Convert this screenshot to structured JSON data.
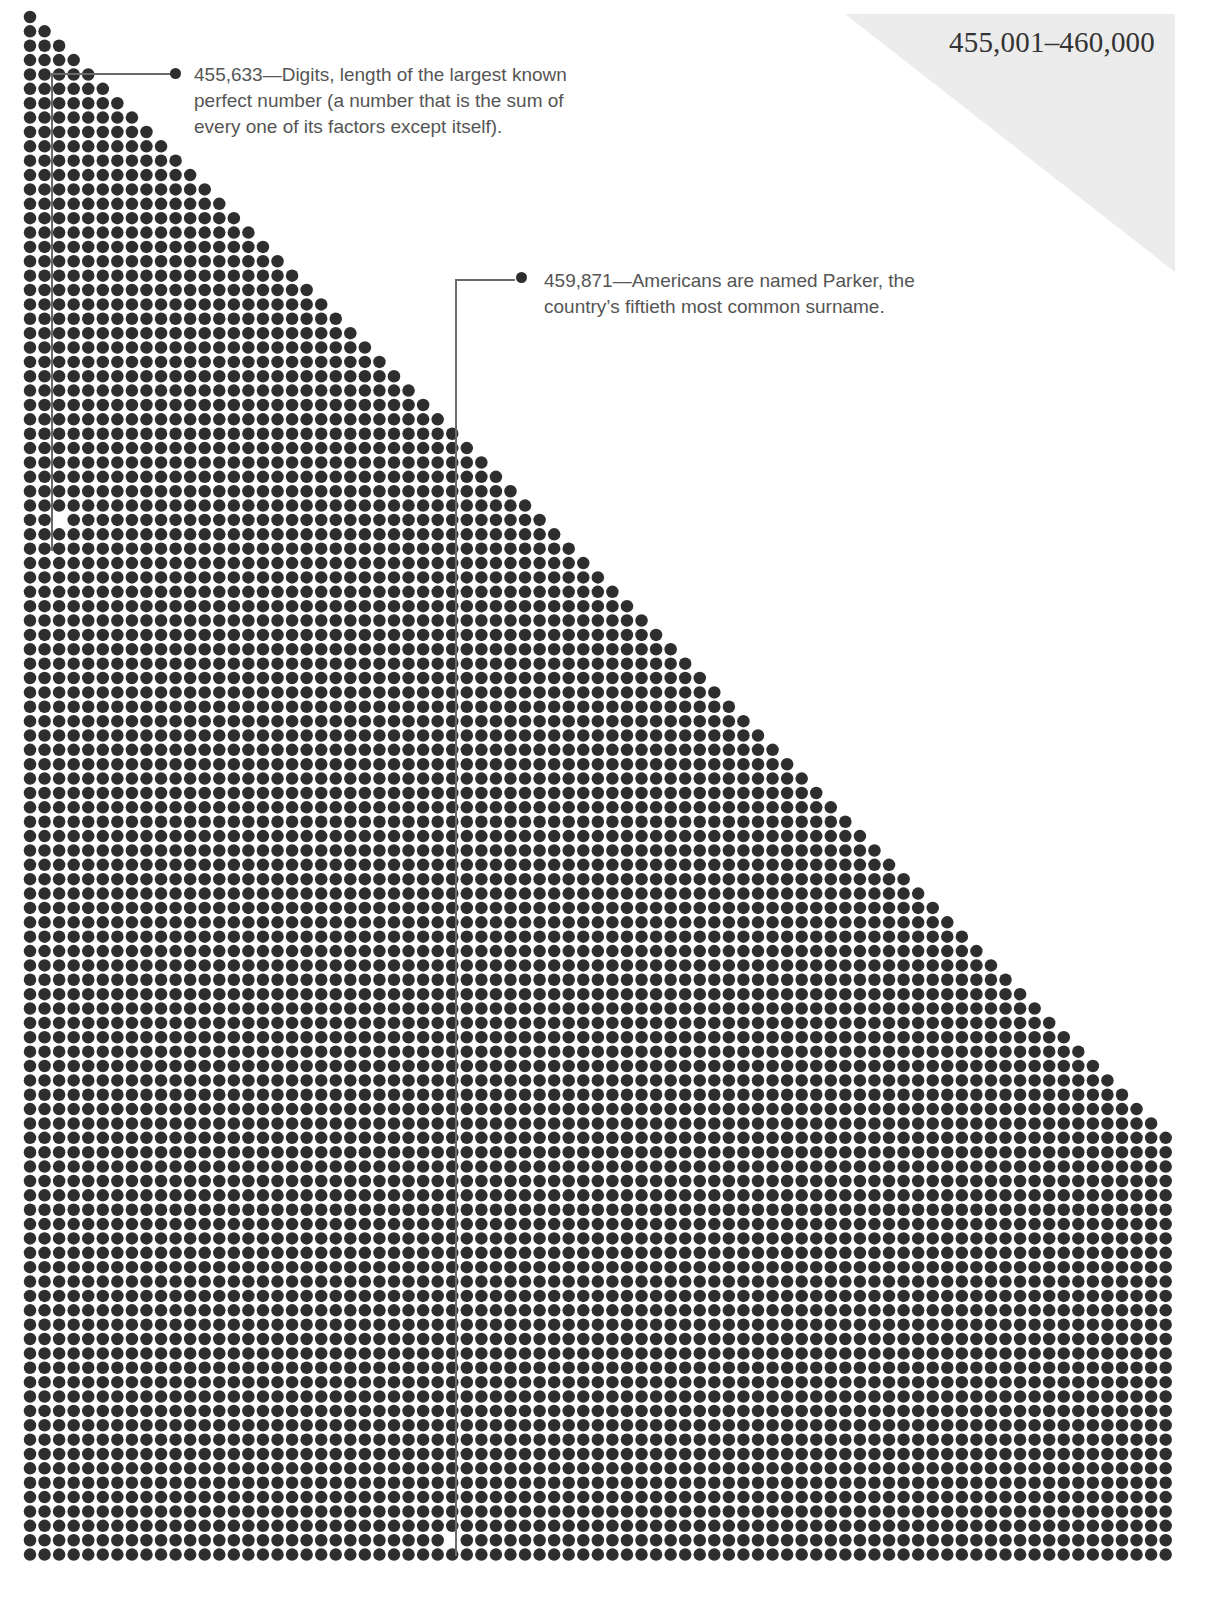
{
  "header": {
    "range_title": "455,001–460,000"
  },
  "colors": {
    "dot": "#2e2e2e",
    "corner_triangle": "#ececec",
    "annotation_text": "#555555",
    "leader_line": "#6a6a6a",
    "title_text": "#333333"
  },
  "annotations": [
    {
      "value": "455,633",
      "line1": "455,633—Digits, length of the largest known",
      "line2": "perfect number (a number that is the sum of",
      "line3": "every one of its factors except itself).",
      "highlight_row": 35,
      "highlight_col": 2
    },
    {
      "value": "459,871",
      "line1": "459,871—Americans are named Parker, the",
      "line2": "country’s fiftieth most common surname.",
      "highlight_row": 106,
      "highlight_col": 29
    }
  ],
  "chart_data": {
    "type": "dot-matrix",
    "title": "455,001–460,000",
    "range_start": 455001,
    "range_end": 460000,
    "layout": {
      "columns": 79,
      "rows": 108,
      "shape": "staircase triangle: row r shows min(r+1, columns) dots, then full rows",
      "origin_x": 30,
      "origin_y": 17,
      "pitch_x": 14.56,
      "pitch_y": 14.37,
      "dot_diameter": 12.5
    },
    "highlighted": [
      {
        "number": 455633,
        "row": 35,
        "col": 2,
        "label": "Digits, length of the largest known perfect number (a number that is the sum of every one of its factors except itself)."
      },
      {
        "number": 459871,
        "row": 106,
        "col": 29,
        "label": "Americans are named Parker, the country’s fiftieth most common surname."
      }
    ]
  }
}
